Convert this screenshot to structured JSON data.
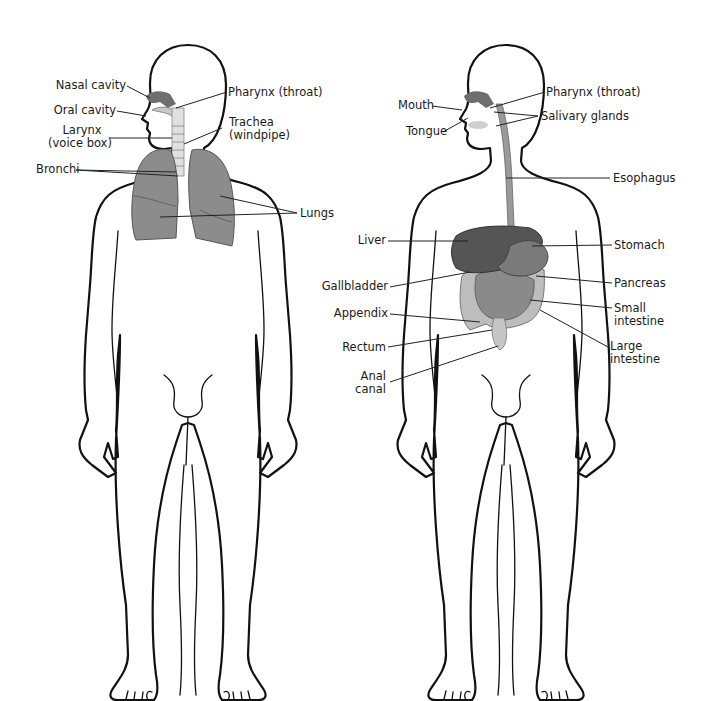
{
  "figures": [
    {
      "name": "Respiratory system",
      "labels": {
        "nasal_cavity": "Nasal cavity",
        "oral_cavity": "Oral cavity",
        "larynx_1": "Larynx",
        "larynx_2": "(voice box)",
        "pharynx": "Pharynx (throat)",
        "trachea_1": "Trachea",
        "trachea_2": "(windpipe)",
        "bronchi": "Bronchi",
        "lungs": "Lungs"
      }
    },
    {
      "name": "Digestive system",
      "labels": {
        "mouth": "Mouth",
        "tongue": "Tongue",
        "pharynx": "Pharynx (throat)",
        "salivary_glands": "Salivary glands",
        "esophagus": "Esophagus",
        "liver": "Liver",
        "stomach": "Stomach",
        "gallbladder": "Gallbladder",
        "pancreas": "Pancreas",
        "appendix": "Appendix",
        "small_intestine_1": "Small",
        "small_intestine_2": "intestine",
        "rectum": "Rectum",
        "large_intestine_1": "Large",
        "large_intestine_2": "intestine",
        "anal_canal_1": "Anal",
        "anal_canal_2": "canal"
      }
    }
  ],
  "colors": {
    "organ_dark": "#5a5a5a",
    "organ_mid": "#8c8c8c",
    "organ_light": "#bdbdbd",
    "outline": "#111111",
    "background": "#ffffff"
  }
}
